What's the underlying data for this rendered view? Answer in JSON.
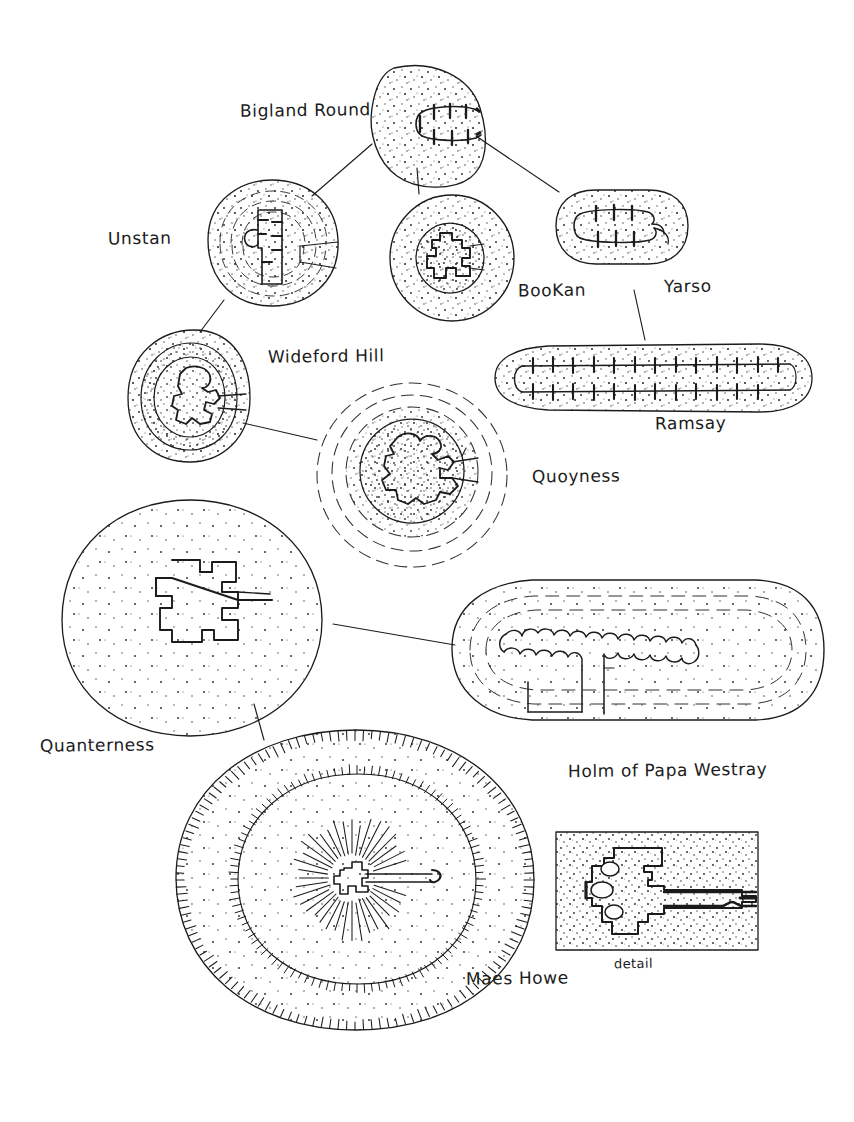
{
  "figure": {
    "background_color": "#ffffff",
    "ink_color": "#1b1b1b",
    "style": "hand-drawn pen and ink, stippled cairn fill, linked schematic"
  },
  "labels": {
    "bigland_round": "Bigland Round",
    "unstan": "Unstan",
    "bookan": "BooKan",
    "yarso": "Yarso",
    "wideford_hill": "Wideford Hill",
    "ramsay": "Ramsay",
    "quoyness": "Quoyness",
    "quanterness": "Quanterness",
    "holm_of_papa_westray": "Holm of Papa Westray",
    "maes_howe": "Maes Howe",
    "detail": "detail"
  },
  "monuments": [
    {
      "id": "bigland-round",
      "name": "Bigland Round",
      "cairn_shape": "round",
      "chamber_type": "stalled",
      "stall_pairs": 3,
      "label_position": "left"
    },
    {
      "id": "unstan",
      "name": "Unstan",
      "cairn_shape": "round",
      "chamber_type": "stalled with side cell",
      "stall_pairs": 4,
      "concentric_walls": 3,
      "label_position": "left"
    },
    {
      "id": "bookan",
      "name": "BooKan",
      "cairn_shape": "round",
      "chamber_type": "compartmented",
      "concentric_walls": 2,
      "label_position": "right"
    },
    {
      "id": "yarso",
      "name": "Yarso",
      "cairn_shape": "oblong",
      "chamber_type": "stalled",
      "stall_pairs": 3,
      "label_position": "right"
    },
    {
      "id": "wideford-hill",
      "name": "Wideford Hill",
      "cairn_shape": "round",
      "chamber_type": "cruciform / Maes Howe type",
      "concentric_walls": 3,
      "label_position": "right"
    },
    {
      "id": "ramsay",
      "name": "Ramsay",
      "cairn_shape": "long oblong",
      "chamber_type": "stalled",
      "stall_pairs": 13,
      "label_position": "below"
    },
    {
      "id": "quoyness",
      "name": "Quoyness",
      "cairn_shape": "round",
      "chamber_type": "central chamber with side cells",
      "concentric_walls": 3,
      "label_position": "right"
    },
    {
      "id": "quanterness",
      "name": "Quanterness",
      "cairn_shape": "large round",
      "chamber_type": "central chamber with six side cells",
      "label_position": "below-left"
    },
    {
      "id": "holm-of-papa-westray",
      "name": "Holm of Papa Westray",
      "cairn_shape": "long oval",
      "chamber_type": "long chamber with many side cells",
      "label_position": "below"
    },
    {
      "id": "maes-howe",
      "name": "Maes Howe",
      "cairn_shape": "great round mound with ditch and bank",
      "chamber_type": "cruciform with long entrance passage",
      "concentric_rings": 3,
      "label_position": "below-right"
    },
    {
      "id": "maes-howe-detail",
      "name": "detail",
      "cairn_shape": "rectangular inset box",
      "chamber_type": "enlarged plan of Maes Howe chamber and passage",
      "label_position": "below"
    }
  ],
  "connections": [
    {
      "from": "Bigland Round",
      "to": "Unstan"
    },
    {
      "from": "Bigland Round",
      "to": "BooKan"
    },
    {
      "from": "Bigland Round",
      "to": "Yarso"
    },
    {
      "from": "Unstan",
      "to": "Wideford Hill"
    },
    {
      "from": "Yarso",
      "to": "Ramsay"
    },
    {
      "from": "Wideford Hill",
      "to": "Quoyness"
    },
    {
      "from": "Quanterness",
      "to": "Holm of Papa Westray"
    },
    {
      "from": "Quanterness",
      "to": "Maes Howe"
    }
  ]
}
